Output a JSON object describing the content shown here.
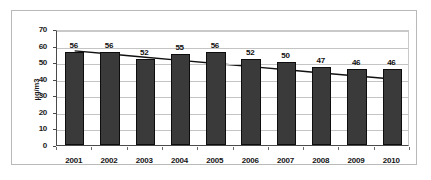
{
  "chart_data": {
    "type": "bar",
    "title": "",
    "xlabel": "",
    "ylabel": "µg/m3",
    "categories": [
      "2001",
      "2002",
      "2003",
      "2004",
      "2005",
      "2006",
      "2007",
      "2008",
      "2009",
      "2010"
    ],
    "values": [
      56,
      56,
      52,
      55,
      56,
      52,
      50,
      47,
      46,
      46
    ],
    "data_labels": [
      "56",
      "56",
      "52",
      "55",
      "56",
      "52",
      "50",
      "47",
      "46",
      "46"
    ],
    "ylim": [
      0,
      70
    ],
    "ytick_values": [
      0,
      10,
      20,
      30,
      40,
      50,
      60,
      70
    ],
    "ytick_labels": [
      "0",
      "10",
      "20",
      "30",
      "40",
      "50",
      "60",
      "70"
    ],
    "grid": true,
    "legend": false,
    "legend_position": "none",
    "series": [
      {
        "name": "µg/m3",
        "type": "bar",
        "values": [
          56,
          56,
          52,
          55,
          56,
          52,
          50,
          47,
          46,
          46
        ],
        "color": "#3a3a3a",
        "edge_color": "#0d0d0d"
      },
      {
        "name": "trendline",
        "type": "line",
        "values": [
          58.0,
          56.1,
          54.2,
          52.3,
          50.4,
          48.5,
          46.6,
          44.7,
          42.8,
          41.0
        ],
        "color": "#111111"
      }
    ],
    "annotations": []
  },
  "colors": {
    "bar_fill": "#3a3a3a",
    "bar_edge": "#0d0d0d",
    "gridline": "#c4c4c4",
    "axis": "#4a4a4a",
    "frame": "#b9b9b9",
    "background": "#ffffff",
    "text": "#1a1a1a",
    "trendline": "#111111"
  }
}
